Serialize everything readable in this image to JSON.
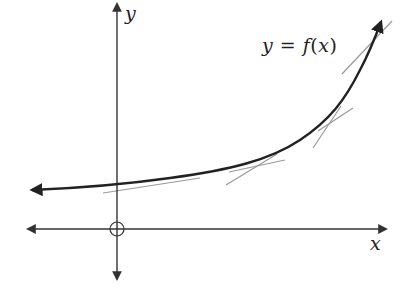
{
  "figure": {
    "type": "function-graph-with-tangents"
  },
  "labels": {
    "x_axis": "x",
    "y_axis": "y",
    "equation_lhs": "y",
    "equation_eq": "=",
    "equation_fn": "f",
    "equation_open": "(",
    "equation_var": "x",
    "equation_close": ")"
  },
  "colors": {
    "axis": "#333333",
    "curve": "#222222",
    "tangent": "#999999",
    "background": "#ffffff"
  },
  "geometry": {
    "origin": [
      117,
      229
    ],
    "x_axis": {
      "from": [
        28,
        229
      ],
      "to": [
        386,
        229
      ]
    },
    "y_axis": {
      "from": [
        117,
        279
      ],
      "to": [
        117,
        4
      ]
    },
    "curve_path": "M 32 190 C 80 188, 120 185, 170 178 C 230 170, 270 160, 300 140 C 330 120, 345 100, 360 70 C 368 55, 375 38, 381 22",
    "tangents": [
      {
        "from": [
          103,
          193
        ],
        "to": [
          200,
          178
        ]
      },
      {
        "from": [
          226,
          185
        ],
        "to": [
          277,
          154
        ]
      },
      {
        "from": [
          229,
          172
        ],
        "to": [
          285,
          160
        ]
      },
      {
        "from": [
          313,
          148
        ],
        "to": [
          341,
          106
        ]
      },
      {
        "from": [
          318,
          131
        ],
        "to": [
          353,
          108
        ]
      },
      {
        "from": [
          342,
          74
        ],
        "to": [
          392,
          21
        ]
      }
    ]
  }
}
